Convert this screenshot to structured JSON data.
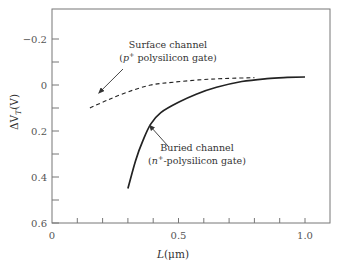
{
  "chart_data": {
    "type": "line",
    "title": "",
    "xlabel": "L(μm)",
    "ylabel": "ΔVₜ(V)",
    "ylabel_main": "ΔV",
    "ylabel_sub": "T",
    "ylabel_unit": "(V)",
    "xlabel_italic": "L",
    "xlabel_unit": "(μm)",
    "xlim": [
      0,
      1.1
    ],
    "ylim": [
      -0.32,
      0.6
    ],
    "y_inverted": true,
    "grid": false,
    "x_ticks": [
      {
        "value": 0,
        "label": "0"
      },
      {
        "value": 0.5,
        "label": "0.5"
      },
      {
        "value": 1.0,
        "label": "1.0"
      }
    ],
    "x_minor_ticks": [
      0.1,
      0.2,
      0.3,
      0.4,
      0.6,
      0.7,
      0.8,
      0.9
    ],
    "y_ticks": [
      {
        "value": -0.2,
        "label": "−0.2"
      },
      {
        "value": 0,
        "label": "0"
      },
      {
        "value": 0.2,
        "label": "0.2"
      },
      {
        "value": 0.4,
        "label": "0.4"
      },
      {
        "value": 0.6,
        "label": "0.6"
      }
    ],
    "y_minor_ticks": [
      -0.1,
      0.1,
      0.3,
      0.5
    ],
    "series": [
      {
        "name": "Surface channel (p+ polysilicon gate)",
        "style": "dashed",
        "x": [
          0.15,
          0.22,
          0.3,
          0.39,
          0.48,
          0.58,
          0.68,
          0.8
        ],
        "y": [
          0.1,
          0.065,
          0.03,
          0.0,
          -0.012,
          -0.022,
          -0.028,
          -0.032
        ]
      },
      {
        "name": "Buried channel (n+-polysilicon gate)",
        "style": "solid",
        "x": [
          0.3,
          0.33,
          0.36,
          0.39,
          0.43,
          0.5,
          0.57,
          0.65,
          0.75,
          0.85,
          0.93,
          1.0
        ],
        "y": [
          0.45,
          0.33,
          0.24,
          0.17,
          0.12,
          0.075,
          0.04,
          0.01,
          -0.015,
          -0.028,
          -0.033,
          -0.035
        ]
      }
    ],
    "annotations": [
      {
        "id": "surface",
        "line1": "Surface channel",
        "line2_pre": "(p",
        "line2_sup": "+",
        "line2_post": " polysilicon gate)",
        "arrow_to": {
          "x": 0.185,
          "y": 0.035
        }
      },
      {
        "id": "buried",
        "line1": "Buried channel",
        "line2_pre": "(n",
        "line2_sup": "+",
        "line2_post": "-polysilicon gate)",
        "arrow_to": {
          "x": 0.385,
          "y": 0.175
        }
      }
    ]
  }
}
